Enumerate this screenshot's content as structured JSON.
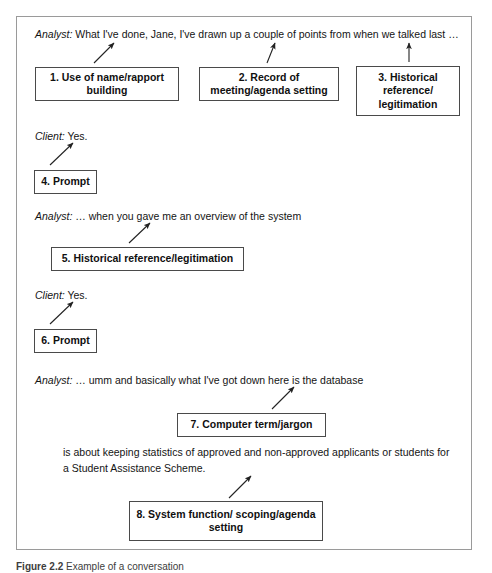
{
  "figure": {
    "caption_label": "Figure 2.2",
    "caption_text": "Example of a conversation"
  },
  "transcript": [
    {
      "id": "line-1",
      "speaker": "Analyst:",
      "text": " What I've done, Jane, I've drawn up a couple of points from when we talked last …"
    },
    {
      "id": "line-2",
      "speaker": "Client:",
      "text": " Yes."
    },
    {
      "id": "line-3",
      "speaker": "Analyst:",
      "text": " … when you gave me an overview of the system"
    },
    {
      "id": "line-4",
      "speaker": "Client:",
      "text": " Yes."
    },
    {
      "id": "line-5",
      "speaker": "Analyst:",
      "text": " … umm and basically what I've got down here is the database"
    }
  ],
  "continuation_paragraph": "is about keeping statistics of approved and non-approved applicants or students for a Student Assistance Scheme.",
  "annotations": [
    {
      "id": 1,
      "label": "1. Use of name/rapport building"
    },
    {
      "id": 2,
      "label": "2. Record of meeting/agenda setting"
    },
    {
      "id": 3,
      "label": "3. Historical reference/ legitimation"
    },
    {
      "id": 4,
      "label": "4. Prompt"
    },
    {
      "id": 5,
      "label": "5. Historical reference/legitimation"
    },
    {
      "id": 6,
      "label": "6. Prompt"
    },
    {
      "id": 7,
      "label": "7. Computer term/jargon"
    },
    {
      "id": 8,
      "label": "8. System function/ scoping/agenda setting"
    }
  ],
  "colors": {
    "frame_border": "#9a9a9a",
    "box_border": "#4a4a4a",
    "text": "#141414",
    "arrow": "#222222"
  }
}
